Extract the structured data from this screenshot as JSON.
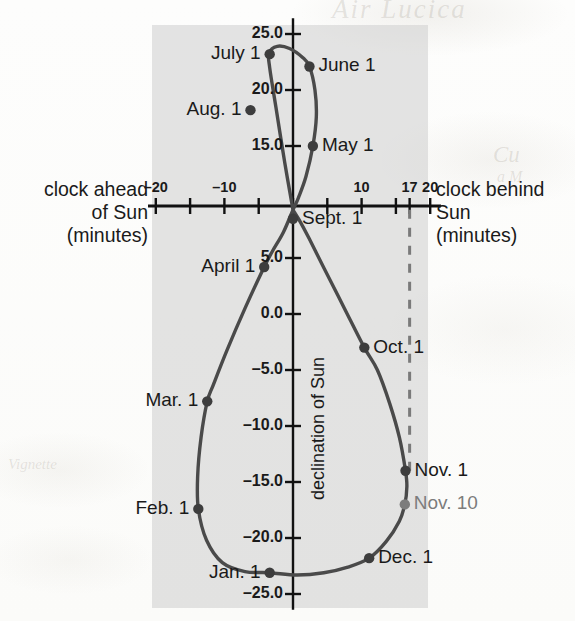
{
  "figure": {
    "kind": "analemma",
    "axis_left_label_lines": [
      "clock ahead",
      "of Sun",
      "(minutes)"
    ],
    "axis_right_label_lines": [
      "clock behind",
      "Sun",
      "(minutes)"
    ],
    "vertical_axis_title": "declination of Sun",
    "watermark": {
      "top": "Air Lucica",
      "right_1": "Cu",
      "right_2": "a M",
      "left": "Vignette"
    },
    "colors": {
      "panel": "#cdcdcd",
      "curve": "#4a4a4a",
      "marker": "#3d3d3d",
      "muted_text": "#7c7c7c",
      "text": "#1a1a1a",
      "dashed_guide": "#7a7a7a"
    }
  },
  "chart_data": {
    "type": "scatter",
    "title": "",
    "xlabel": "equation of time (minutes)",
    "ylabel": "declination of Sun (degrees)",
    "xlim": [
      -22,
      22
    ],
    "ylim": [
      -26.5,
      26.5
    ],
    "grid": false,
    "legend": "none",
    "x_ticks": [
      -20,
      -15,
      -10,
      -5,
      0,
      5,
      10,
      15,
      17,
      20
    ],
    "x_tick_labels": [
      {
        "value": -20,
        "label": "–20"
      },
      {
        "value": -10,
        "label": "–10"
      },
      {
        "value": 10,
        "label": "10"
      },
      {
        "value": 17,
        "label": "17"
      },
      {
        "value": 20,
        "label": "20"
      }
    ],
    "y_ticks": [
      25.0,
      20.0,
      15.0,
      5.0,
      0.0,
      -5.0,
      -10.0,
      -15.0,
      -20.0,
      -25.0
    ],
    "y_tick_labels": [
      "25.0",
      "20.0",
      "15.0",
      "5.0",
      "0.0",
      "–5.0",
      "–10.0",
      "–15.0",
      "–20.0",
      "–25.0"
    ],
    "annotations": [
      {
        "name": "dashed-guide",
        "type": "vline",
        "x": 17,
        "from_y": 9.3,
        "to_y": -14.0,
        "style": "dashed"
      }
    ],
    "points": [
      {
        "label": "Jan. 1",
        "x": -3.4,
        "y": -23.1,
        "label_side": "left",
        "muted": false
      },
      {
        "label": "Feb. 1",
        "x": -13.8,
        "y": -17.4,
        "label_side": "left",
        "muted": false
      },
      {
        "label": "Mar. 1",
        "x": -12.5,
        "y": -7.8,
        "label_side": "left",
        "muted": false
      },
      {
        "label": "April 1",
        "x": -4.2,
        "y": 4.2,
        "label_side": "left",
        "muted": false
      },
      {
        "label": "May 1",
        "x": 2.9,
        "y": 15.0,
        "label_side": "right",
        "muted": false
      },
      {
        "label": "June 1",
        "x": 2.4,
        "y": 22.1,
        "label_side": "right",
        "muted": false
      },
      {
        "label": "July 1",
        "x": -3.4,
        "y": 23.2,
        "label_side": "left",
        "muted": false
      },
      {
        "label": "Aug. 1",
        "x": -6.2,
        "y": 18.2,
        "label_side": "left",
        "muted": false
      },
      {
        "label": "Sept. 1",
        "x": 0.0,
        "y": 8.5,
        "label_side": "right",
        "muted": false
      },
      {
        "label": "Oct. 1",
        "x": 10.4,
        "y": -3.0,
        "label_side": "right",
        "muted": false
      },
      {
        "label": "Nov. 1",
        "x": 16.4,
        "y": -14.0,
        "label_side": "right",
        "muted": false
      },
      {
        "label": "Nov. 10",
        "x": 16.3,
        "y": -17.0,
        "label_side": "right",
        "muted": true
      },
      {
        "label": "Dec. 1",
        "x": 11.1,
        "y": -21.8,
        "label_side": "right",
        "muted": false
      }
    ],
    "curve": [
      {
        "x": 0.0,
        "y": 9.3
      },
      {
        "x": -1.2,
        "y": 13.5
      },
      {
        "x": -2.5,
        "y": 18.5
      },
      {
        "x": -3.4,
        "y": 22.0
      },
      {
        "x": -3.5,
        "y": 23.3
      },
      {
        "x": -2.3,
        "y": 23.9
      },
      {
        "x": -0.5,
        "y": 23.7
      },
      {
        "x": 1.4,
        "y": 22.9
      },
      {
        "x": 2.4,
        "y": 22.1
      },
      {
        "x": 3.2,
        "y": 20.0
      },
      {
        "x": 3.4,
        "y": 17.6
      },
      {
        "x": 2.9,
        "y": 15.0
      },
      {
        "x": 1.9,
        "y": 12.3
      },
      {
        "x": 0.8,
        "y": 10.4
      },
      {
        "x": 0.0,
        "y": 9.3
      },
      {
        "x": -1.4,
        "y": 7.3
      },
      {
        "x": -3.0,
        "y": 5.6
      },
      {
        "x": -4.2,
        "y": 4.2
      },
      {
        "x": -7.0,
        "y": 0.5
      },
      {
        "x": -9.6,
        "y": -3.2
      },
      {
        "x": -11.6,
        "y": -6.3
      },
      {
        "x": -12.5,
        "y": -7.8
      },
      {
        "x": -13.4,
        "y": -11.0
      },
      {
        "x": -13.9,
        "y": -14.5
      },
      {
        "x": -13.8,
        "y": -17.4
      },
      {
        "x": -12.6,
        "y": -20.2
      },
      {
        "x": -10.3,
        "y": -22.2
      },
      {
        "x": -7.0,
        "y": -23.0
      },
      {
        "x": -3.4,
        "y": -23.1
      },
      {
        "x": 0.6,
        "y": -23.3
      },
      {
        "x": 4.5,
        "y": -23.1
      },
      {
        "x": 8.0,
        "y": -22.6
      },
      {
        "x": 11.1,
        "y": -21.8
      },
      {
        "x": 13.6,
        "y": -20.3
      },
      {
        "x": 15.5,
        "y": -18.5
      },
      {
        "x": 16.3,
        "y": -17.0
      },
      {
        "x": 16.6,
        "y": -15.4
      },
      {
        "x": 16.4,
        "y": -14.0
      },
      {
        "x": 15.5,
        "y": -11.0
      },
      {
        "x": 14.1,
        "y": -8.0
      },
      {
        "x": 12.3,
        "y": -5.0
      },
      {
        "x": 10.4,
        "y": -3.0
      },
      {
        "x": 7.5,
        "y": 0.5
      },
      {
        "x": 4.6,
        "y": 4.0
      },
      {
        "x": 2.3,
        "y": 6.8
      },
      {
        "x": 0.9,
        "y": 8.4
      },
      {
        "x": 0.0,
        "y": 9.3
      }
    ]
  }
}
